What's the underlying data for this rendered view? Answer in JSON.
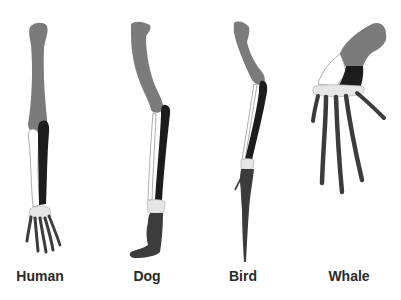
{
  "caption_fragment": "...",
  "colors": {
    "humerus": "#7b7b7b",
    "radius": "#1c1c1c",
    "ulna": "#ffffff",
    "ulna_outline": "#9a9a9a",
    "carpals": "#e8e8e8",
    "digits": "#3c3c3c"
  },
  "limbs": [
    {
      "label": "Human"
    },
    {
      "label": "Dog"
    },
    {
      "label": "Bird"
    },
    {
      "label": "Whale"
    }
  ]
}
